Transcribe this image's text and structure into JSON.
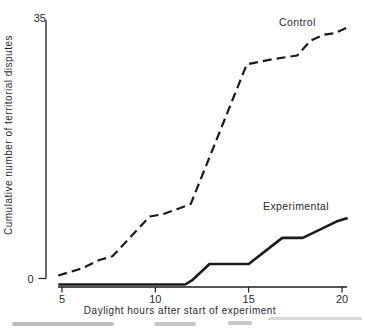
{
  "chart_data": {
    "type": "line",
    "title": "",
    "xlabel": "Daylight hours after start of experiment",
    "ylabel": "Cumulative number of territorial disputes",
    "xlim": [
      4.8,
      20.5
    ],
    "ylim": [
      0,
      35
    ],
    "x_ticks": [
      5,
      10,
      15,
      20
    ],
    "y_ticks": [
      0,
      35
    ],
    "grid": false,
    "legend_position": "inline-labels",
    "background": "#ffffff",
    "ink_color": "#1c1c1c",
    "series": [
      {
        "name": "Control",
        "line_style": "dashed",
        "color": "#1c1c1c",
        "points": [
          [
            4.8,
            0.4
          ],
          [
            6.1,
            1.4
          ],
          [
            7.0,
            2.5
          ],
          [
            7.7,
            3.0
          ],
          [
            9.7,
            8.4
          ],
          [
            10.4,
            8.7
          ],
          [
            11.3,
            9.5
          ],
          [
            11.9,
            10.1
          ],
          [
            14.9,
            29.0
          ],
          [
            16.3,
            29.7
          ],
          [
            17.6,
            30.2
          ],
          [
            18.3,
            32.2
          ],
          [
            19.0,
            33.0
          ],
          [
            19.6,
            33.2
          ],
          [
            20.3,
            34.0
          ]
        ]
      },
      {
        "name": "Experimental",
        "line_style": "solid",
        "color": "#1c1c1c",
        "points": [
          [
            4.8,
            0
          ],
          [
            11.6,
            0
          ],
          [
            12.0,
            0.4
          ],
          [
            12.9,
            2.1
          ],
          [
            15.0,
            2.1
          ],
          [
            16.8,
            5.5
          ],
          [
            17.9,
            5.5
          ],
          [
            19.7,
            7.7
          ],
          [
            20.3,
            8.2
          ]
        ]
      }
    ],
    "annotations": [
      {
        "text": "Control",
        "series": "Control"
      },
      {
        "text": "Experimental",
        "series": "Experimental"
      }
    ]
  }
}
